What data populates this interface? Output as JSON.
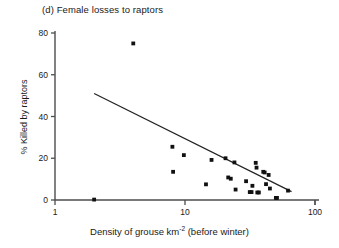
{
  "figure": {
    "panel_label": "(d) Female losses to raptors"
  },
  "axes": {
    "y_title": "% Killed by raptors",
    "x_title_main": "Density of grouse km",
    "x_title_sup": "-2",
    "x_title_tail": " (before winter)",
    "y_ticks": [
      "0",
      "20",
      "40",
      "60",
      "80"
    ],
    "x_ticks": [
      "1",
      "10",
      "100"
    ]
  },
  "style": {
    "axis_color": "#4d4d4d",
    "point_color": "#111111",
    "line_color": "#222222"
  },
  "chart_data": {
    "type": "scatter",
    "title": "(d) Female losses to raptors",
    "xlabel": "Density of grouse km-2 (before winter)",
    "ylabel": "% Killed by raptors",
    "xscale": "log",
    "yscale": "linear",
    "xlim": [
      1,
      100
    ],
    "ylim": [
      0,
      80
    ],
    "xticks": [
      1,
      10,
      100
    ],
    "yticks": [
      0,
      20,
      40,
      60,
      80
    ],
    "grid": false,
    "legend": "none",
    "series": [
      {
        "name": "Female losses to raptors",
        "marker": "filled-square",
        "points": [
          [
            2.0,
            0.2
          ],
          [
            4.0,
            75.0
          ],
          [
            8.0,
            25.5
          ],
          [
            8.1,
            13.5
          ],
          [
            9.8,
            21.5
          ],
          [
            14.5,
            7.5
          ],
          [
            16.0,
            19.2
          ],
          [
            20.5,
            20.0
          ],
          [
            21.5,
            10.8
          ],
          [
            22.5,
            10.2
          ],
          [
            24.0,
            18.0
          ],
          [
            24.5,
            5.0
          ],
          [
            29.5,
            9.0
          ],
          [
            31.5,
            3.8
          ],
          [
            32.5,
            3.8
          ],
          [
            33.0,
            6.8
          ],
          [
            35.0,
            17.8
          ],
          [
            35.5,
            15.5
          ],
          [
            36.0,
            3.6
          ],
          [
            37.0,
            3.6
          ],
          [
            40.0,
            13.5
          ],
          [
            41.0,
            13.2
          ],
          [
            42.0,
            7.6
          ],
          [
            44.0,
            12.0
          ],
          [
            45.0,
            5.5
          ],
          [
            50.0,
            1.0
          ],
          [
            51.0,
            1.0
          ],
          [
            62.0,
            4.5
          ]
        ]
      }
    ],
    "fit_line": {
      "name": "regression line",
      "start": [
        2.0,
        51.0
      ],
      "end": [
        66.0,
        4.0
      ]
    }
  }
}
